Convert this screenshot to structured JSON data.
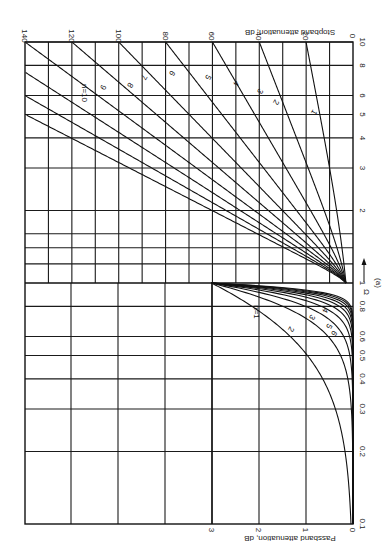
{
  "figure": {
    "rotation": "rotated 90 degrees clockwise (plot axis Omega runs vertically, attenuation runs horizontally, right to left)",
    "panel_label": "(a)",
    "omega_axis_label": "Ω",
    "passband_axis_label": "Passband attenuation, dB",
    "stopband_axis_label": "Stopband attenuation, dB"
  },
  "chart_data": {
    "type": "line",
    "subtitle": "(a)",
    "xlabel": "Ω",
    "x_scale": "log",
    "x_range": [
      0.1,
      10
    ],
    "x_ticks": [
      "0.1",
      "0.2",
      "0.3",
      "0.4",
      "0.5",
      "0.6",
      "0.8",
      "1",
      "2",
      "3",
      "4",
      "5",
      "6",
      "8",
      "10"
    ],
    "passband": {
      "ylabel": "Passband attenuation, dB",
      "x_range": [
        0.1,
        1
      ],
      "y_range": [
        0,
        3
      ],
      "y_ticks": [
        "0",
        "1",
        "2",
        "3"
      ],
      "series": [
        {
          "name": "n=1",
          "x": [
            0.1,
            0.2,
            0.3,
            0.4,
            0.5,
            0.6,
            0.7,
            0.8,
            0.9,
            1.0
          ],
          "values": [
            0.04,
            0.17,
            0.37,
            0.64,
            0.97,
            1.34,
            1.73,
            2.15,
            2.58,
            3.01
          ]
        },
        {
          "name": "n=2",
          "x": [
            0.1,
            0.2,
            0.3,
            0.4,
            0.5,
            0.6,
            0.7,
            0.8,
            0.9,
            1.0
          ],
          "values": [
            0.0,
            0.01,
            0.04,
            0.11,
            0.26,
            0.53,
            0.93,
            1.48,
            2.18,
            3.01
          ]
        },
        {
          "name": "n=3",
          "x": [
            0.1,
            0.2,
            0.3,
            0.4,
            0.5,
            0.6,
            0.7,
            0.8,
            0.9,
            1.0
          ],
          "values": [
            0.0,
            0.0,
            0.0,
            0.02,
            0.07,
            0.19,
            0.47,
            1.0,
            1.83,
            3.01
          ]
        },
        {
          "name": "n=4",
          "x": [
            0.1,
            0.2,
            0.3,
            0.4,
            0.5,
            0.6,
            0.7,
            0.8,
            0.9,
            1.0
          ],
          "values": [
            0.0,
            0.0,
            0.0,
            0.0,
            0.02,
            0.07,
            0.23,
            0.66,
            1.52,
            3.01
          ]
        },
        {
          "name": "n=5",
          "x": [
            0.1,
            0.2,
            0.3,
            0.4,
            0.5,
            0.6,
            0.7,
            0.8,
            0.9,
            1.0
          ],
          "values": [
            0.0,
            0.0,
            0.0,
            0.0,
            0.0,
            0.03,
            0.12,
            0.43,
            1.26,
            3.01
          ]
        },
        {
          "name": "n=6",
          "x": [
            0.1,
            0.2,
            0.3,
            0.4,
            0.5,
            0.6,
            0.7,
            0.8,
            0.9,
            1.0
          ],
          "values": [
            0.0,
            0.0,
            0.0,
            0.0,
            0.0,
            0.01,
            0.06,
            0.28,
            1.04,
            3.01
          ]
        },
        {
          "name": "n=7",
          "x": [
            0.1,
            0.2,
            0.3,
            0.4,
            0.5,
            0.6,
            0.7,
            0.8,
            0.9,
            1.0
          ],
          "values": [
            0.0,
            0.0,
            0.0,
            0.0,
            0.0,
            0.0,
            0.03,
            0.18,
            0.85,
            3.01
          ]
        },
        {
          "name": "n=8",
          "x": [
            0.1,
            0.2,
            0.3,
            0.4,
            0.5,
            0.6,
            0.7,
            0.8,
            0.9,
            1.0
          ],
          "values": [
            0.0,
            0.0,
            0.0,
            0.0,
            0.0,
            0.0,
            0.01,
            0.12,
            0.7,
            3.01
          ]
        },
        {
          "name": "n=9",
          "x": [
            0.1,
            0.2,
            0.3,
            0.4,
            0.5,
            0.6,
            0.7,
            0.8,
            0.9,
            1.0
          ],
          "values": [
            0.0,
            0.0,
            0.0,
            0.0,
            0.0,
            0.0,
            0.01,
            0.08,
            0.57,
            3.01
          ]
        },
        {
          "name": "n=10",
          "x": [
            0.1,
            0.2,
            0.3,
            0.4,
            0.5,
            0.6,
            0.7,
            0.8,
            0.9,
            1.0
          ],
          "values": [
            0.0,
            0.0,
            0.0,
            0.0,
            0.0,
            0.0,
            0.0,
            0.05,
            0.47,
            3.01
          ]
        }
      ]
    },
    "stopband": {
      "ylabel": "Stopband attenuation, dB",
      "x_range": [
        1,
        10
      ],
      "y_range": [
        0,
        140
      ],
      "y_ticks": [
        "0",
        "20",
        "40",
        "60",
        "80",
        "100",
        "120",
        "140"
      ],
      "series": [
        {
          "name": "1",
          "x": [
            1,
            2,
            3,
            4,
            5,
            6,
            8,
            10
          ],
          "values": [
            3.0,
            7.0,
            10.0,
            12.3,
            14.1,
            15.7,
            18.1,
            20.0
          ]
        },
        {
          "name": "2",
          "x": [
            1,
            2,
            3,
            4,
            5,
            6,
            8,
            10
          ],
          "values": [
            3.0,
            12.3,
            19.1,
            24.1,
            28.0,
            31.1,
            36.1,
            40.0
          ]
        },
        {
          "name": "3",
          "x": [
            1,
            2,
            3,
            4,
            5,
            6,
            8,
            10
          ],
          "values": [
            3.0,
            18.1,
            28.6,
            36.1,
            41.9,
            46.7,
            54.2,
            60.0
          ]
        },
        {
          "name": "4",
          "x": [
            1,
            2,
            3,
            4,
            5,
            6,
            8,
            10
          ],
          "values": [
            3.0,
            24.1,
            38.2,
            48.2,
            55.9,
            62.2,
            72.2,
            80.0
          ]
        },
        {
          "name": "5",
          "x": [
            1,
            2,
            3,
            4,
            5,
            6,
            8,
            10
          ],
          "values": [
            3.0,
            30.1,
            47.7,
            60.2,
            69.9,
            77.8,
            90.3,
            100.0
          ]
        },
        {
          "name": "6",
          "x": [
            1,
            2,
            3,
            4,
            5,
            6,
            8,
            10
          ],
          "values": [
            3.0,
            36.1,
            57.3,
            72.2,
            83.9,
            93.4,
            108.4,
            120.0
          ]
        },
        {
          "name": "7",
          "x": [
            1,
            2,
            3,
            4,
            5,
            6,
            8,
            10
          ],
          "values": [
            3.0,
            42.1,
            66.8,
            84.3,
            97.9,
            108.9,
            126.4,
            140.0
          ]
        },
        {
          "name": "8",
          "x": [
            1,
            2,
            3,
            4,
            5,
            6,
            8,
            10
          ],
          "values": [
            3.0,
            48.2,
            76.3,
            96.3,
            111.8,
            124.5,
            144.5,
            160.0
          ]
        },
        {
          "name": "9",
          "x": [
            1,
            2,
            3,
            4,
            5,
            6,
            8,
            10
          ],
          "values": [
            3.0,
            54.2,
            85.9,
            108.4,
            125.8,
            140.0,
            162.6,
            180.0
          ]
        },
        {
          "name": "n=10",
          "x": [
            1,
            2,
            3,
            4,
            5,
            6,
            8,
            10
          ],
          "values": [
            3.0,
            60.2,
            95.4,
            120.4,
            139.8,
            155.6,
            180.6,
            200.0
          ]
        }
      ]
    },
    "curve_labels_passband": [
      "n=1",
      "2",
      "3",
      "4",
      "5",
      "6"
    ],
    "curve_labels_stopband": [
      "n=10",
      "9",
      "8",
      "7",
      "6",
      "5",
      "4",
      "3",
      "2",
      "1"
    ],
    "grid": true,
    "legend": "none (curves labelled inline)"
  }
}
